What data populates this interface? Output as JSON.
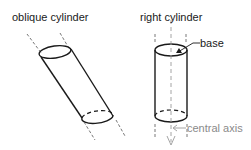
{
  "diagram": {
    "oblique": {
      "title": "oblique cylinder"
    },
    "right": {
      "title": "right cylinder",
      "base_label": "base",
      "axis_label": "central axis"
    }
  },
  "colors": {
    "stroke": "#1a1a1a",
    "axis": "#9a9a9a",
    "background": "#ffffff"
  }
}
